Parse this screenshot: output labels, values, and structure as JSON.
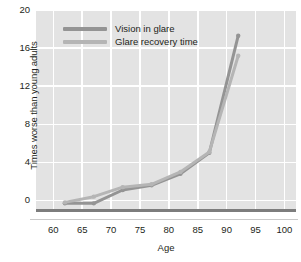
{
  "chart_data": {
    "type": "line",
    "title": "",
    "xlabel": "Age",
    "ylabel": "Times worse than young adults",
    "xlim": [
      57,
      102
    ],
    "ylim": [
      -1,
      20
    ],
    "xticks": [
      60,
      65,
      70,
      75,
      80,
      85,
      90,
      95,
      100
    ],
    "yticks": [
      0,
      4,
      8,
      12,
      16,
      20
    ],
    "grid": true,
    "legend_position": "top-left-inside",
    "x": [
      62,
      67,
      72,
      77,
      82,
      87,
      92
    ],
    "series": [
      {
        "name": "Vision in glare",
        "color": "#949494",
        "values": [
          -0.3,
          -0.3,
          1.1,
          1.6,
          2.8,
          5.0,
          17.3
        ]
      },
      {
        "name": "Glare recovery time",
        "color": "#b5b5b5",
        "values": [
          -0.2,
          0.4,
          1.4,
          1.7,
          3.0,
          5.1,
          15.2
        ]
      }
    ],
    "axis_colors": {
      "plot_background": "#e3e3e3",
      "gridline": "#ffffff",
      "zero_baseline": "#7d7d7d",
      "bottom_axis": "#c9c9c9",
      "tick_text": "#231f20"
    }
  }
}
